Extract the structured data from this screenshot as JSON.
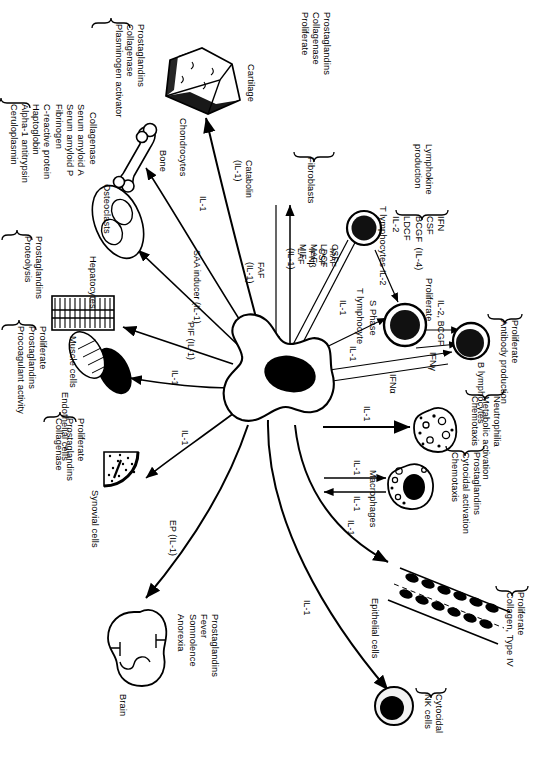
{
  "figure": {
    "center_cell": "Macrophage"
  },
  "nodes": {
    "fibroblasts": {
      "label": "Fibroblasts",
      "effects": "Prostaglandins\nCollagenase\nProliferate"
    },
    "t_lympho_1": {
      "label": "T lymphocytes",
      "effects": "IFN\nCSF\nBCGF  (IL-4)\nLDCF\nIL-2",
      "effects_title": "Lymphokine\nproduction"
    },
    "t_lympho_2": {
      "label": "T lymphocyte",
      "effects": "Proliferate",
      "sub": "S Phase"
    },
    "b_lympho": {
      "label": "B lymphocytes",
      "effects": "Proliferate\nAntibody production"
    },
    "neutrophil": {
      "label": "",
      "effects": "Neutrophilia\nMetabolic activation\nChemotaxis"
    },
    "macrophages": {
      "label": "Macrophages",
      "effects": "Prostaglandins\nCytocidal activation\nChemotaxis"
    },
    "epithelial": {
      "label": "Epithelial cells",
      "effects": "Proliferate\nCollagen, Type IV"
    },
    "nk": {
      "label": "NK cells",
      "effects": "Cytocidal"
    },
    "brain": {
      "label": "Brain",
      "effects": "Prostaglandins\nFever\nSomnolence\nAnorexia"
    },
    "synovial": {
      "label": "Synovial cells",
      "effects": "Proliferate\nProstaglandins\nCollagenase"
    },
    "endothelial": {
      "label": "Endothelial cells",
      "effects": "Proliferate\nProstaglandins\nProcoagulant activity"
    },
    "muscle": {
      "label": "Muscle cells",
      "effects": "Prostaglandins\nProteolysis"
    },
    "hepatocytes": {
      "label": "Hepatocytes",
      "effects": "Serum amyloid A\nSerum amyloid P\nFibrinogen\nC-reactive protein\nHaptoglobin\nAlpha-1 antitrypsin\nCeruloplasmin"
    },
    "osteoclasts": {
      "label": "Osteoclasts",
      "effects": "Collagenase",
      "organ": "Bone"
    },
    "chondrocytes": {
      "label": "Chondrocytes",
      "effects": "Prostaglandins\nCollagenase\nPlasminogen activator",
      "organ": "Cartilage"
    }
  },
  "mediators": {
    "to_fibroblast": "MAF\nCSF\nIFNβ\nLAF\n(IL-1)",
    "from_fibroblast": "FAF\n(IL-1)",
    "to_tcell_1": "CSF\nLDCF\nMAF\nMIF",
    "ifn_gamma_back": "IFNγ",
    "t_to_t": "IL-2",
    "t_to_b": "IL-2, BCGF",
    "t_to_b_2": "IFNγ",
    "b_to_center": "IFNα",
    "il1_to_t2": "IL-1",
    "il1_to_b": "IL-1",
    "il1_to_neutrophil": "IL-1",
    "il1_mac_out": "IL-1",
    "il1_mac_in": "IL-1",
    "il1_epithelial": "IL-1",
    "il1_nk": "IL-1",
    "ep_brain": "EP (IL-1)",
    "il1_synovial": "IL-1",
    "il1_endothelial": "IL-1",
    "pif_muscle": "PIF (IL-1)",
    "saa_hepatocytes": "SAA inducer (IL-1)",
    "il1_osteoclast": "IL-1",
    "catabolin_chondro": "Catabolin\n(IL-1)"
  },
  "colors": {
    "ink": "#000000",
    "paper": "#ffffff"
  }
}
